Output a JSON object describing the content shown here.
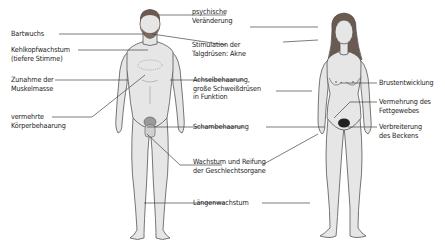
{
  "diagram": {
    "colors": {
      "skin": "#e6e6e6",
      "outline": "#555555",
      "hair": "#6a5a50",
      "line": "#444444",
      "text": "#222222"
    },
    "left_labels": [
      {
        "id": "bartwuchs",
        "lines": [
          "Bartwuchs"
        ]
      },
      {
        "id": "kehlkopf",
        "lines": [
          "Kehlkopfwachstum",
          "(tiefere Stimme)"
        ]
      },
      {
        "id": "muskel",
        "lines": [
          "Zunahme der",
          "Muskelmasse"
        ]
      },
      {
        "id": "koerperhaar",
        "lines": [
          "vermehrte",
          "Körperbehaarung"
        ]
      }
    ],
    "center_labels": [
      {
        "id": "psyche",
        "lines": [
          "psychische",
          "Veränderung"
        ]
      },
      {
        "id": "talg",
        "lines": [
          "Stimulation der",
          "Talgdrüsen: Akne"
        ]
      },
      {
        "id": "achsel",
        "lines": [
          "Achselbehaarung,",
          "große Schweißdrüsen",
          "in Funktion"
        ]
      },
      {
        "id": "scham",
        "lines": [
          "Schambehaarung"
        ]
      },
      {
        "id": "geschlecht",
        "lines": [
          "Wachstum und Reifung",
          "der Geschlechtsorgane"
        ]
      },
      {
        "id": "laenge",
        "lines": [
          "Längenwachstum"
        ]
      }
    ],
    "right_labels": [
      {
        "id": "brust",
        "lines": [
          "Brustentwicklung"
        ]
      },
      {
        "id": "fett",
        "lines": [
          "Vermehrung des",
          "Fettgewebes"
        ]
      },
      {
        "id": "becken",
        "lines": [
          "Verbreiterung",
          "des Beckens"
        ]
      }
    ],
    "figures": [
      {
        "id": "male",
        "name": "male-figure"
      },
      {
        "id": "female",
        "name": "female-figure"
      }
    ]
  }
}
